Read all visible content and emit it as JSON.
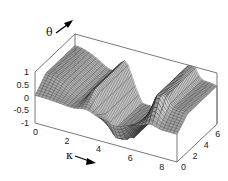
{
  "chart_data": {
    "type": "surface3d",
    "title": "",
    "xlabel": "κ",
    "ylabel": "θ",
    "zlabel": "",
    "x_ticks": [
      "0",
      "2",
      "4",
      "6",
      "8"
    ],
    "y_ticks": [
      "0",
      "2",
      "4",
      "6"
    ],
    "z_ticks": [
      "1",
      "0.5",
      "0",
      "-0.5",
      "-1"
    ],
    "xlim": [
      0,
      9
    ],
    "ylim": [
      0,
      7
    ],
    "zlim": [
      -1,
      1
    ],
    "grid": false,
    "legend": null,
    "render_style": "wireframe mesh, grey shaded",
    "surface_description": "Surface oscillates in κ: high plateau (~1) at small κ on the far θ side, sharp ridges running along θ near κ≈3 and κ≈7 reaching z≈1, with a deep trough between them near κ≈5 dropping to z≈-1; near θ=0 the surface flattens toward ~0.",
    "mesh": {
      "nx": 40,
      "ny": 32
    }
  },
  "labels": {
    "kappa": "κ",
    "theta": "θ"
  },
  "colors": {
    "mesh_line": "#1a1a1a",
    "surface_light": "#bdbdbd",
    "surface_dark": "#4a4a4a",
    "box": "#555555",
    "arrow": "#000000"
  }
}
